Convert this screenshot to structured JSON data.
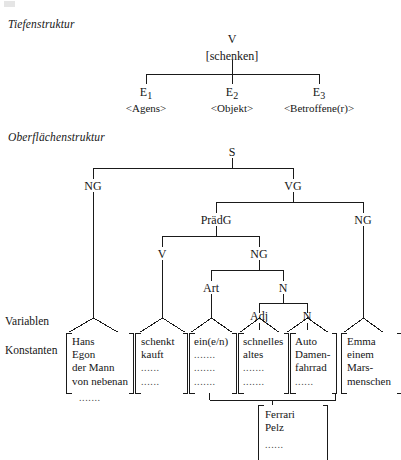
{
  "figure": {
    "sections": [
      {
        "id": "deep",
        "label": "Tiefenstruktur"
      },
      {
        "id": "surface",
        "label": "Oberflächenstruktur"
      }
    ],
    "row_labels": [
      {
        "id": "variablen",
        "label": "Variablen"
      },
      {
        "id": "konstanten",
        "label": "Konstanten"
      }
    ]
  },
  "deep_structure": {
    "root": {
      "label": "V",
      "feature": "[schenken]"
    },
    "children": [
      {
        "label": "E",
        "index": "1",
        "role": "<Agens>"
      },
      {
        "label": "E",
        "index": "2",
        "role": "<Objekt>"
      },
      {
        "label": "E",
        "index": "3",
        "role": "<Betroffene(r)>"
      }
    ]
  },
  "surface_structure": {
    "nodes": [
      {
        "id": "s",
        "label": "S"
      },
      {
        "id": "ng-subject",
        "label": "NG"
      },
      {
        "id": "vg",
        "label": "VG"
      },
      {
        "id": "praedg",
        "label": "PrädG"
      },
      {
        "id": "ng-object-right",
        "label": "NG"
      },
      {
        "id": "v",
        "label": "V"
      },
      {
        "id": "ng-object",
        "label": "NG"
      },
      {
        "id": "art",
        "label": "Art"
      },
      {
        "id": "n1",
        "label": "N"
      },
      {
        "id": "adj",
        "label": "Adj"
      },
      {
        "id": "n2",
        "label": "N"
      }
    ]
  },
  "constant_columns": [
    {
      "id": "col-hans",
      "items": [
        "Hans",
        "Egon",
        "der Mann",
        "von nebenan"
      ],
      "trailing": "......."
    },
    {
      "id": "col-schenkt",
      "items": [
        "schenkt",
        "kauft",
        "......",
        "......"
      ],
      "trailing": null
    },
    {
      "id": "col-ein",
      "items": [
        "ein(e/n)",
        ".......",
        ".......",
        "......."
      ],
      "trailing": null
    },
    {
      "id": "col-schnelles",
      "items": [
        "schnelles",
        "altes",
        ".......",
        "......."
      ],
      "trailing": null
    },
    {
      "id": "col-auto",
      "items": [
        "Auto",
        "Damen-",
        "fahrrad",
        "......"
      ],
      "trailing": null
    },
    {
      "id": "col-emma",
      "items": [
        "Emma",
        "einem",
        "Mars-",
        "menschen"
      ],
      "trailing": null
    }
  ],
  "merged_column": {
    "id": "col-ferrari",
    "items": [
      "Ferrari",
      "Pelz",
      "......"
    ]
  },
  "colors": {
    "ink": "#161616",
    "line": "#1a1a1a",
    "paper": "#ffffff",
    "dots": "#4a4a4a"
  }
}
